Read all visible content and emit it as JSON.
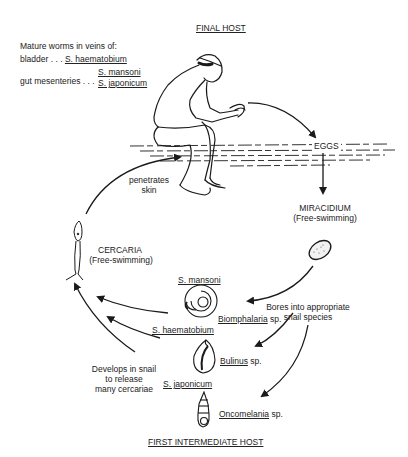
{
  "final_host": {
    "title": "FINAL HOST",
    "intro": "Mature worms in veins of:",
    "bladder_label": "bladder . . .",
    "bladder_species": "S. haematobium",
    "gut_label": "gut mesenteries . . .",
    "gut_species": [
      "S. mansoni",
      "S. japonicum"
    ]
  },
  "stages": {
    "eggs": "EGGS",
    "miracidium": "MIRACIDIUM",
    "miracidium_note": "(Free-swimming)",
    "cercaria": "CERCARIA",
    "cercaria_note": "(Free-swimming)"
  },
  "transitions": {
    "penetrates_line1": "penetrates",
    "penetrates_line2": "skin",
    "bores_line1": "Bores into appropriate",
    "bores_line2": "snail species",
    "develops_line1": "Develops in snail",
    "develops_line2": "to release",
    "develops_line3": "many cercariae"
  },
  "snails": [
    {
      "parasite": "S. mansoni",
      "genus": "Biomphalaria",
      "suffix": " sp."
    },
    {
      "parasite": "S. haematobium",
      "genus": "Bulinus",
      "suffix": " sp."
    },
    {
      "parasite": "S. japonicum",
      "genus": "Oncomelania",
      "suffix": " sp."
    }
  ],
  "intermediate_host": {
    "title": "FIRST INTERMEDIATE HOST"
  }
}
